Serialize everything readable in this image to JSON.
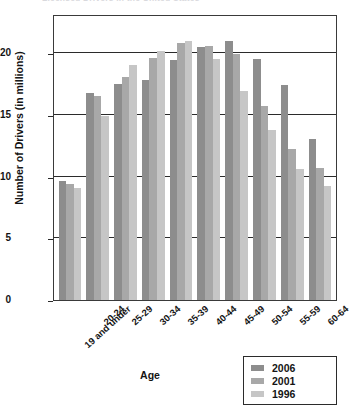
{
  "title": "Licensed Drivers in the United States",
  "axis": {
    "ylabel": "Number of Drivers (in millions)",
    "xlabel": "Age",
    "yticks": [
      "0",
      "5",
      "10",
      "15",
      "20"
    ]
  },
  "legend": {
    "items": [
      {
        "label": "2006",
        "color": "#8d8d8d"
      },
      {
        "label": "2001",
        "color": "#a8a8a8"
      },
      {
        "label": "1996",
        "color": "#c6c6c6"
      }
    ]
  },
  "chart_data": {
    "type": "bar",
    "title": "Licensed Drivers in the United States",
    "xlabel": "Age",
    "ylabel": "Number of Drivers (in millions)",
    "ylim": [
      0,
      23
    ],
    "yticks": [
      0,
      5,
      10,
      15,
      20
    ],
    "grid": true,
    "legend_position": "bottom-right",
    "categories": [
      "19 and under",
      "20-24",
      "25-29",
      "30-34",
      "35-39",
      "40-44",
      "45-49",
      "50-54",
      "55-59",
      "60-64"
    ],
    "series": [
      {
        "name": "2006",
        "color": "#8d8d8d",
        "values": [
          9.6,
          16.8,
          17.5,
          17.8,
          19.4,
          20.5,
          21.0,
          19.5,
          17.4,
          13.0
        ]
      },
      {
        "name": "2001",
        "color": "#a8a8a8",
        "values": [
          9.4,
          16.5,
          18.1,
          19.6,
          20.8,
          20.6,
          19.9,
          15.7,
          12.2,
          10.7
        ]
      },
      {
        "name": "1996",
        "color": "#c6c6c6",
        "values": [
          9.1,
          14.9,
          19.0,
          20.2,
          21.0,
          19.5,
          16.9,
          13.8,
          10.6,
          9.2
        ]
      }
    ]
  }
}
